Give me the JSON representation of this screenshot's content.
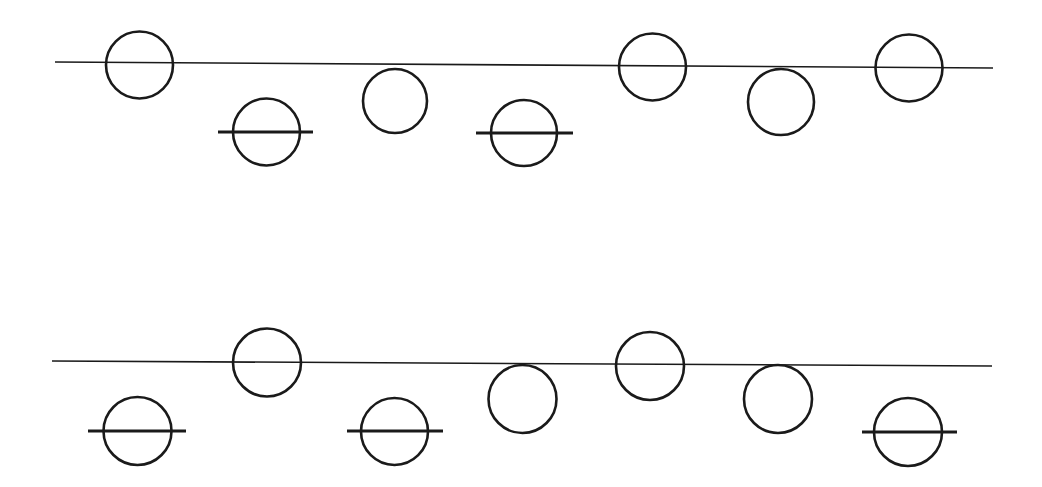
{
  "figure": {
    "width": 1042,
    "height": 487,
    "background_color": "#ffffff",
    "stroke_color": "#1a1a1a",
    "baseline_stroke_width": 1.6,
    "circle_stroke_width": 2.6,
    "tick_stroke_width": 3.0
  },
  "rows": [
    {
      "id": "row-top",
      "name": "top-row",
      "baseline": {
        "name": "top-baseline",
        "x1": 55,
        "y1": 62,
        "x2": 993,
        "y2": 68
      },
      "circles": [
        {
          "id": "top-c1",
          "cx": 139.5,
          "cy": 65,
          "r": 33.5,
          "placement": "on-line",
          "tick": null
        },
        {
          "id": "top-c2",
          "cx": 266.5,
          "cy": 132,
          "r": 33.5,
          "placement": "below-line",
          "tick": {
            "x1": 218,
            "x2": 313,
            "y": 132
          }
        },
        {
          "id": "top-c3",
          "cx": 395,
          "cy": 101,
          "r": 32,
          "placement": "tangent-below",
          "tick": null
        },
        {
          "id": "top-c4",
          "cx": 524,
          "cy": 133,
          "r": 33,
          "placement": "below-line",
          "tick": {
            "x1": 476,
            "x2": 573,
            "y": 133
          }
        },
        {
          "id": "top-c5",
          "cx": 652.5,
          "cy": 67,
          "r": 33.5,
          "placement": "on-line",
          "tick": null
        },
        {
          "id": "top-c6",
          "cx": 781,
          "cy": 102,
          "r": 33,
          "placement": "tangent-below",
          "tick": null
        },
        {
          "id": "top-c7",
          "cx": 909,
          "cy": 68,
          "r": 33.5,
          "placement": "on-line",
          "tick": null
        }
      ]
    },
    {
      "id": "row-bottom",
      "name": "bottom-row",
      "baseline": {
        "name": "bottom-baseline",
        "x1": 52,
        "y1": 361,
        "x2": 992,
        "y2": 366
      },
      "circles": [
        {
          "id": "bot-c1",
          "cx": 137.5,
          "cy": 431,
          "r": 34,
          "placement": "below-line",
          "tick": {
            "x1": 88,
            "x2": 186,
            "y": 431
          }
        },
        {
          "id": "bot-c2",
          "cx": 267,
          "cy": 362.5,
          "r": 34,
          "placement": "on-line",
          "tick": null
        },
        {
          "id": "bot-c3",
          "cx": 394.5,
          "cy": 431.5,
          "r": 33.5,
          "placement": "below-line",
          "tick": {
            "x1": 347,
            "x2": 443,
            "y": 431
          }
        },
        {
          "id": "bot-c4",
          "cx": 522.5,
          "cy": 399,
          "r": 34,
          "placement": "tangent-below",
          "tick": null
        },
        {
          "id": "bot-c5",
          "cx": 650,
          "cy": 366,
          "r": 34,
          "placement": "on-line",
          "tick": null
        },
        {
          "id": "bot-c6",
          "cx": 778,
          "cy": 399,
          "r": 34,
          "placement": "tangent-below",
          "tick": null
        },
        {
          "id": "bot-c7",
          "cx": 908,
          "cy": 432,
          "r": 34,
          "placement": "below-line",
          "tick": {
            "x1": 862,
            "x2": 957,
            "y": 432
          }
        }
      ]
    }
  ]
}
